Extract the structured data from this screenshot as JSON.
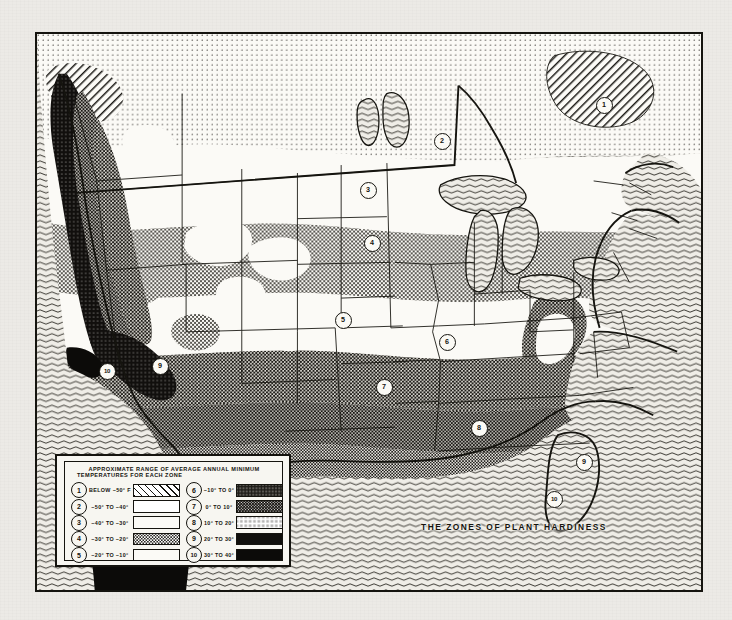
{
  "document": {
    "caption": "THE ZONES OF PLANT HARDINESS",
    "kind": "plant-hardiness-zone-map"
  },
  "legend": {
    "title_line1": "APPROXIMATE  RANGE  OF  AVERAGE  ANNUAL  MINIMUM",
    "title_line2": "TEMPERATURES  FOR  EACH  ZONE",
    "left_column": [
      {
        "zone": "1",
        "label": "BELOW  −50° F",
        "pattern": "diagonal-hatch"
      },
      {
        "zone": "2",
        "label": "−50°  TO  −40°",
        "pattern": "fine-dots"
      },
      {
        "zone": "3",
        "label": "−40°  TO  −30°",
        "pattern": "white"
      },
      {
        "zone": "4",
        "label": "−30°  TO  −20°",
        "pattern": "light-stipple"
      },
      {
        "zone": "5",
        "label": "−20°  TO  −10°",
        "pattern": "white"
      }
    ],
    "right_column": [
      {
        "zone": "6",
        "label": "−10°  TO    0°",
        "pattern": "medium-stipple"
      },
      {
        "zone": "7",
        "label": "  0°  TO   10°",
        "pattern": "dark-solid"
      },
      {
        "zone": "8",
        "label": " 10°  TO   20°",
        "pattern": "dark-stipple"
      },
      {
        "zone": "9",
        "label": " 20°  TO   30°",
        "pattern": "very-dark"
      },
      {
        "zone": "10",
        "label": " 30°  TO   40°",
        "pattern": "black"
      }
    ]
  },
  "map_markers": [
    {
      "zone": "1",
      "x": 566,
      "y": 70
    },
    {
      "zone": "2",
      "x": 404,
      "y": 106
    },
    {
      "zone": "3",
      "x": 330,
      "y": 155
    },
    {
      "zone": "4",
      "x": 334,
      "y": 208
    },
    {
      "zone": "5",
      "x": 305,
      "y": 285
    },
    {
      "zone": "6",
      "x": 409,
      "y": 307
    },
    {
      "zone": "7",
      "x": 346,
      "y": 352
    },
    {
      "zone": "8",
      "x": 441,
      "y": 393
    },
    {
      "zone": "9",
      "x": 546,
      "y": 427
    },
    {
      "zone": "10",
      "x": 516,
      "y": 464
    },
    {
      "zone": "9",
      "x": 122,
      "y": 331
    },
    {
      "zone": "10",
      "x": 69,
      "y": 336
    }
  ],
  "colors": {
    "ink": "#15140f",
    "paper": "#eceae6",
    "map_background": "#f2f1ec",
    "ocean": "#ebe9e3"
  }
}
